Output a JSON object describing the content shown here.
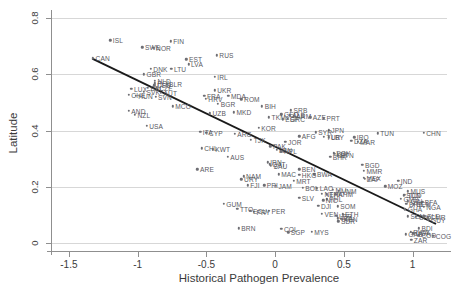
{
  "chart_data": {
    "type": "scatter",
    "title": "",
    "xlabel": "Historical Pathogen Prevalence",
    "ylabel": "Latitude",
    "xlim": [
      -1.63,
      1.25
    ],
    "ylim": [
      -0.028,
      0.815
    ],
    "xticks": [
      -1.5,
      -1,
      -0.5,
      0,
      0.5,
      1
    ],
    "xticklabels": [
      "-1.5",
      "-1",
      "-0.5",
      "0",
      "0.5",
      "1"
    ],
    "yticks": [
      0,
      0.2,
      0.4,
      0.6,
      0.8
    ],
    "yticklabels": [
      "0",
      "0.2",
      "0.4",
      "0.6",
      "0.8"
    ],
    "grid": "horizontal",
    "legend": "none",
    "point_color": "#6e6e74",
    "line_color": "#1a1a1a",
    "fit_line": {
      "type": "linear",
      "x": [
        -1.33,
        1.17
      ],
      "y": [
        0.656,
        0.068
      ]
    },
    "points": [
      {
        "label": "ISL",
        "x": -1.2,
        "y": 0.722
      },
      {
        "label": "FIN",
        "x": -0.76,
        "y": 0.718
      },
      {
        "label": "SWE",
        "x": -0.965,
        "y": 0.696
      },
      {
        "label": "NOR",
        "x": -0.885,
        "y": 0.694
      },
      {
        "label": "CAN",
        "x": -1.325,
        "y": 0.657
      },
      {
        "label": "RUS",
        "x": -0.425,
        "y": 0.668
      },
      {
        "label": "EST",
        "x": -0.645,
        "y": 0.654
      },
      {
        "label": "LVA",
        "x": -0.63,
        "y": 0.636
      },
      {
        "label": "DNK",
        "x": -0.905,
        "y": 0.62
      },
      {
        "label": "LTU",
        "x": -0.755,
        "y": 0.619
      },
      {
        "label": "GBR",
        "x": -0.955,
        "y": 0.6
      },
      {
        "label": "IRL",
        "x": -0.44,
        "y": 0.592
      },
      {
        "label": "NLD",
        "x": -0.875,
        "y": 0.577
      },
      {
        "label": "POL",
        "x": -0.875,
        "y": 0.568
      },
      {
        "label": "DEU",
        "x": -0.878,
        "y": 0.561
      },
      {
        "label": "BLR",
        "x": -0.79,
        "y": 0.565
      },
      {
        "label": "BEL",
        "x": -0.925,
        "y": 0.552
      },
      {
        "label": "CZE",
        "x": -0.862,
        "y": 0.551
      },
      {
        "label": "LUX",
        "x": -1.045,
        "y": 0.548
      },
      {
        "label": "UKR",
        "x": -0.44,
        "y": 0.543
      },
      {
        "label": "SVK",
        "x": -0.955,
        "y": 0.539
      },
      {
        "label": "AUT",
        "x": -0.83,
        "y": 0.534
      },
      {
        "label": "CHE",
        "x": -1.065,
        "y": 0.527
      },
      {
        "label": "FRA",
        "x": -0.515,
        "y": 0.523
      },
      {
        "label": "HUN",
        "x": -1.015,
        "y": 0.524
      },
      {
        "label": "MDA",
        "x": -0.34,
        "y": 0.523
      },
      {
        "label": "SVN",
        "x": -0.87,
        "y": 0.521
      },
      {
        "label": "HRV",
        "x": -0.505,
        "y": 0.513
      },
      {
        "label": "ROM",
        "x": -0.245,
        "y": 0.512
      },
      {
        "label": "BGR",
        "x": -0.415,
        "y": 0.496
      },
      {
        "label": "MCO",
        "x": -0.745,
        "y": 0.486
      },
      {
        "label": "BIH",
        "x": -0.095,
        "y": 0.487
      },
      {
        "label": "AND",
        "x": -1.065,
        "y": 0.47
      },
      {
        "label": "SRB",
        "x": 0.115,
        "y": 0.472
      },
      {
        "label": "MKD",
        "x": -0.3,
        "y": 0.466
      },
      {
        "label": "UZB",
        "x": -0.475,
        "y": 0.462
      },
      {
        "label": "GEO",
        "x": 0.045,
        "y": 0.458
      },
      {
        "label": "ALB",
        "x": 0.105,
        "y": 0.455
      },
      {
        "label": "ARM",
        "x": 0.135,
        "y": 0.451
      },
      {
        "label": "NZL",
        "x": -1.02,
        "y": 0.456
      },
      {
        "label": "TKM",
        "x": -0.045,
        "y": 0.448
      },
      {
        "label": "AZE",
        "x": 0.255,
        "y": 0.448
      },
      {
        "label": "PRT",
        "x": 0.355,
        "y": 0.444
      },
      {
        "label": "GRC",
        "x": 0.09,
        "y": 0.443
      },
      {
        "label": "ESP",
        "x": 0.055,
        "y": 0.44
      },
      {
        "label": "USA",
        "x": -0.935,
        "y": 0.417
      },
      {
        "label": "KOR",
        "x": -0.12,
        "y": 0.41
      },
      {
        "label": "ITA",
        "x": -0.545,
        "y": 0.395
      },
      {
        "label": "CYP",
        "x": -0.5,
        "y": 0.392
      },
      {
        "label": "JPN",
        "x": 0.39,
        "y": 0.402
      },
      {
        "label": "SYR",
        "x": 0.295,
        "y": 0.394
      },
      {
        "label": "ARG",
        "x": -0.295,
        "y": 0.388
      },
      {
        "label": "TUN",
        "x": 0.745,
        "y": 0.39
      },
      {
        "label": "CHN",
        "x": 1.08,
        "y": 0.392
      },
      {
        "label": "AFG",
        "x": 0.175,
        "y": 0.38
      },
      {
        "label": "TUR",
        "x": 0.355,
        "y": 0.379
      },
      {
        "label": "LBY",
        "x": 0.39,
        "y": 0.376
      },
      {
        "label": "IRQ",
        "x": 0.575,
        "y": 0.376
      },
      {
        "label": "TJK",
        "x": -0.175,
        "y": 0.368
      },
      {
        "label": "JOR",
        "x": 0.075,
        "y": 0.361
      },
      {
        "label": "DZA",
        "x": 0.555,
        "y": 0.364
      },
      {
        "label": "MAR",
        "x": 0.6,
        "y": 0.361
      },
      {
        "label": "PAK",
        "x": -0.035,
        "y": 0.344
      },
      {
        "label": "CHL",
        "x": -0.535,
        "y": 0.337
      },
      {
        "label": "KWT",
        "x": -0.455,
        "y": 0.334
      },
      {
        "label": "LBN",
        "x": 0.01,
        "y": 0.332
      },
      {
        "label": "NPL",
        "x": 0.045,
        "y": 0.327
      },
      {
        "label": "EGY",
        "x": 0.425,
        "y": 0.322
      },
      {
        "label": "ISR",
        "x": 0.43,
        "y": 0.317
      },
      {
        "label": "BTN",
        "x": 0.455,
        "y": 0.312
      },
      {
        "label": "AUS",
        "x": -0.345,
        "y": 0.306
      },
      {
        "label": "BHR",
        "x": 0.4,
        "y": 0.306
      },
      {
        "label": "IRN",
        "x": -0.055,
        "y": 0.288
      },
      {
        "label": "QAT",
        "x": -0.04,
        "y": 0.281
      },
      {
        "label": "SAU",
        "x": -0.03,
        "y": 0.275
      },
      {
        "label": "BGD",
        "x": 0.635,
        "y": 0.278
      },
      {
        "label": "ARE",
        "x": -0.565,
        "y": 0.263
      },
      {
        "label": "BEN",
        "x": 0.175,
        "y": 0.263
      },
      {
        "label": "MMR",
        "x": 0.645,
        "y": 0.258
      },
      {
        "label": "MAC",
        "x": 0.025,
        "y": 0.245
      },
      {
        "label": "BWA",
        "x": 0.285,
        "y": 0.245
      },
      {
        "label": "HKG",
        "x": 0.175,
        "y": 0.243
      },
      {
        "label": "NAM",
        "x": -0.23,
        "y": 0.238
      },
      {
        "label": "MEX",
        "x": 0.645,
        "y": 0.232
      },
      {
        "label": "ZAF",
        "x": 0.65,
        "y": 0.228
      },
      {
        "label": "URY",
        "x": -0.245,
        "y": 0.227
      },
      {
        "label": "MRT",
        "x": 0.135,
        "y": 0.222
      },
      {
        "label": "IND",
        "x": 0.895,
        "y": 0.222
      },
      {
        "label": "FJI",
        "x": -0.2,
        "y": 0.205
      },
      {
        "label": "PRI",
        "x": -0.08,
        "y": 0.205
      },
      {
        "label": "JAM",
        "x": 0.005,
        "y": 0.203
      },
      {
        "label": "BOL",
        "x": 0.2,
        "y": 0.196
      },
      {
        "label": "LAO",
        "x": 0.305,
        "y": 0.195
      },
      {
        "label": "MOZ",
        "x": 0.8,
        "y": 0.202
      },
      {
        "label": "MLI",
        "x": 0.42,
        "y": 0.189
      },
      {
        "label": "VNM",
        "x": 0.465,
        "y": 0.186
      },
      {
        "label": "MUS",
        "x": 0.965,
        "y": 0.185
      },
      {
        "label": "NER",
        "x": 0.34,
        "y": 0.176
      },
      {
        "label": "THA",
        "x": 0.375,
        "y": 0.173
      },
      {
        "label": "KHM",
        "x": 0.44,
        "y": 0.173
      },
      {
        "label": "TCD",
        "x": 0.945,
        "y": 0.172
      },
      {
        "label": "SDN",
        "x": 0.935,
        "y": 0.17
      },
      {
        "label": "SLV",
        "x": 0.175,
        "y": 0.161
      },
      {
        "label": "GMB",
        "x": 0.915,
        "y": 0.158
      },
      {
        "label": "PHL",
        "x": 0.375,
        "y": 0.156
      },
      {
        "label": "NIC",
        "x": 0.35,
        "y": 0.153
      },
      {
        "label": "GIN",
        "x": 0.965,
        "y": 0.149
      },
      {
        "label": "BFA",
        "x": 1.07,
        "y": 0.148
      },
      {
        "label": "GUM",
        "x": -0.375,
        "y": 0.14
      },
      {
        "label": "BRB",
        "x": 0.955,
        "y": 0.14
      },
      {
        "label": "BEN",
        "x": 1.01,
        "y": 0.138
      },
      {
        "label": "DJI",
        "x": 0.315,
        "y": 0.132
      },
      {
        "label": "SOM",
        "x": 0.455,
        "y": 0.131
      },
      {
        "label": "NGA",
        "x": 1.08,
        "y": 0.13
      },
      {
        "label": "TTO",
        "x": -0.275,
        "y": 0.122
      },
      {
        "label": "GHA",
        "x": 0.945,
        "y": 0.121
      },
      {
        "label": "PER",
        "x": -0.045,
        "y": 0.115
      },
      {
        "label": "PRY",
        "x": -0.155,
        "y": 0.111
      },
      {
        "label": "ECU",
        "x": -0.18,
        "y": 0.115
      },
      {
        "label": "VEN",
        "x": 0.34,
        "y": 0.105
      },
      {
        "label": "ETH",
        "x": 0.49,
        "y": 0.103
      },
      {
        "label": "LBR",
        "x": 0.445,
        "y": 0.098
      },
      {
        "label": "SEN",
        "x": 0.965,
        "y": 0.095
      },
      {
        "label": "CIV",
        "x": 1.025,
        "y": 0.094
      },
      {
        "label": "SLE",
        "x": 1.085,
        "y": 0.095
      },
      {
        "label": "CMR",
        "x": 1.11,
        "y": 0.092
      },
      {
        "label": "TZA",
        "x": 0.455,
        "y": 0.088
      },
      {
        "label": "KEN",
        "x": 0.48,
        "y": 0.086
      },
      {
        "label": "SDR",
        "x": 0.46,
        "y": 0.078
      },
      {
        "label": "GUY",
        "x": 1.115,
        "y": 0.083
      },
      {
        "label": "BRN",
        "x": -0.265,
        "y": 0.053
      },
      {
        "label": "COL",
        "x": 0.045,
        "y": 0.05
      },
      {
        "label": "BDI",
        "x": 1.045,
        "y": 0.053
      },
      {
        "label": "SGP",
        "x": 0.095,
        "y": 0.038
      },
      {
        "label": "MYS",
        "x": 0.265,
        "y": 0.041
      },
      {
        "label": "RWA",
        "x": 0.985,
        "y": 0.04
      },
      {
        "label": "UGA",
        "x": 1.005,
        "y": 0.035
      },
      {
        "label": "GAB",
        "x": 0.95,
        "y": 0.032
      },
      {
        "label": "COD",
        "x": 1.045,
        "y": 0.028
      },
      {
        "label": "COG",
        "x": 1.15,
        "y": 0.026
      },
      {
        "label": "ZAR",
        "x": 0.99,
        "y": 0.012
      }
    ]
  }
}
